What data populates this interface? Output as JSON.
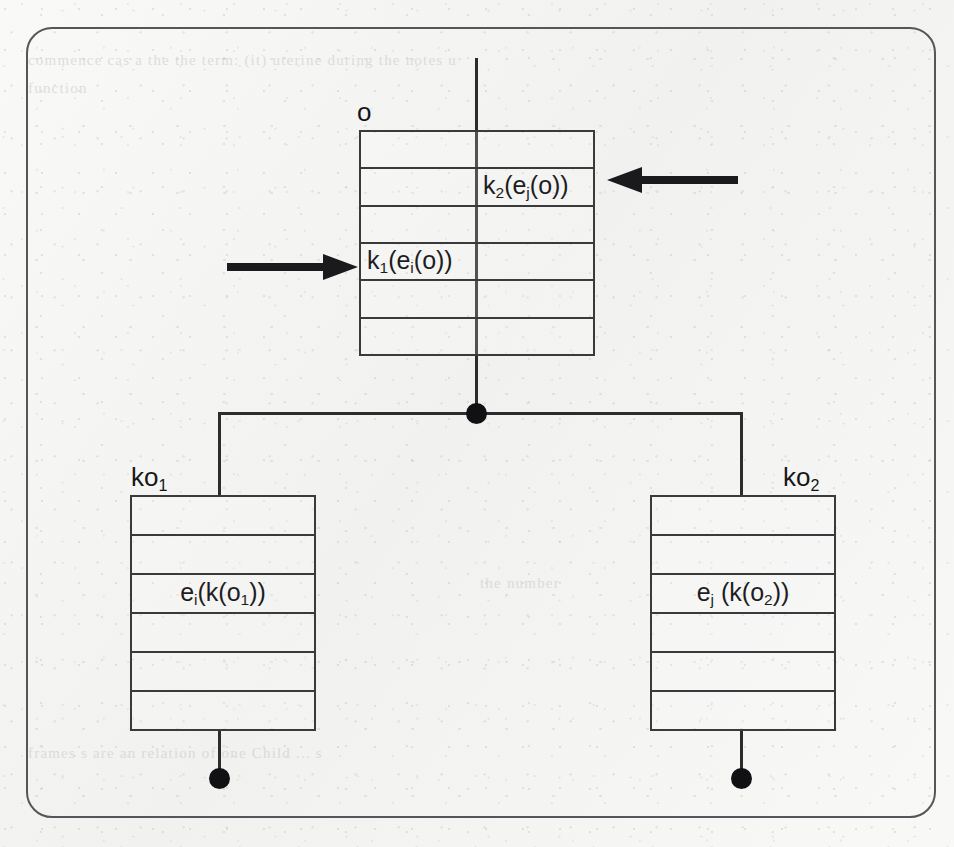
{
  "figure": {
    "kind": "object-reference-diagram",
    "background_color": "#f2f2f0",
    "ink_color": "#2c2c2e",
    "frame": {
      "label": "rounded-frame",
      "border_color": "#56565a"
    }
  },
  "bleed_text": {
    "line1": "commence  cas    a the    the   term: (it) uterine  during   the   notes  u",
    "line2": "function",
    "line3": "the  number",
    "line4": "frames        s    are    an  relation  of one  Child  ...       s"
  },
  "boxes": [
    {
      "id": "parent",
      "label": "o",
      "label_sub": "",
      "rows": 6,
      "slots": [
        {
          "row": 2,
          "text": "k",
          "sub": "2",
          "rest": "(e",
          "sub2": "j",
          "rest2": "(o))",
          "align": "right",
          "full": "k2(ej(o))"
        },
        {
          "row": 4,
          "text": "k",
          "sub": "1",
          "rest": "(e",
          "sub2": "i",
          "rest2": "(o))",
          "align": "left",
          "full": "k1(ei(o))"
        }
      ]
    },
    {
      "id": "child-left",
      "label": "ko",
      "label_sub": "1",
      "rows": 6,
      "slots": [
        {
          "row": 3,
          "text": "e",
          "sub": "i",
          "rest": "(k(o",
          "sub2": "1",
          "rest2": "))",
          "align": "center",
          "full": "ei(k(o1))"
        }
      ]
    },
    {
      "id": "child-right",
      "label": "ko",
      "label_sub": "2",
      "rows": 6,
      "slots": [
        {
          "row": 3,
          "text": "e",
          "sub": "j",
          "rest": " (k(o",
          "sub2": "2",
          "rest2": "))",
          "align": "center",
          "full": "ej (k(o2))"
        }
      ]
    }
  ],
  "arrows": [
    {
      "id": "arrow-into-k1",
      "direction": "right",
      "target_slot": "k1(ei(o))"
    },
    {
      "id": "arrow-into-k2",
      "direction": "left",
      "target_slot": "k2(ej(o))"
    }
  ],
  "connectors": {
    "bus_dot": "filled-junction-dot",
    "terminal_dot_left": "filled-terminal-dot",
    "terminal_dot_right": "filled-terminal-dot"
  }
}
